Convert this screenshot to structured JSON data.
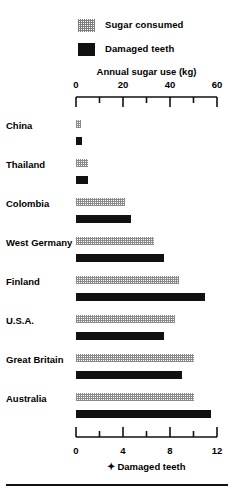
{
  "chart_data": {
    "type": "bar",
    "title": "",
    "orientation": "horizontal",
    "grid": false,
    "legend_position": "top",
    "categories": [
      "China",
      "Thailand",
      "Colombia",
      "West Germany",
      "Finland",
      "U.S.A.",
      "Great Britain",
      "Australia"
    ],
    "series": [
      {
        "name": "Sugar consumed",
        "axis": "top",
        "unit": "kg",
        "values": [
          2,
          5,
          21,
          33,
          44,
          42,
          50,
          50
        ]
      },
      {
        "name": "Damaged teeth",
        "axis": "bottom",
        "unit": "",
        "values": [
          0.5,
          1.0,
          4.7,
          7.5,
          11.0,
          7.5,
          9.0,
          11.5
        ]
      }
    ],
    "top_axis": {
      "label": "Annual sugar use (kg)",
      "lim": [
        0,
        60
      ],
      "major_ticks": [
        0,
        20,
        40,
        60
      ],
      "minor_ticks": [
        10,
        30,
        50
      ],
      "tick_labels": [
        "0",
        "20",
        "40",
        "60"
      ]
    },
    "bottom_axis": {
      "label": "Damaged teeth",
      "marker": "✦",
      "lim": [
        0,
        12
      ],
      "major_ticks": [
        0,
        4,
        8,
        12
      ],
      "minor_ticks": [
        2,
        6,
        10
      ],
      "tick_labels": [
        "0",
        "4",
        "8",
        "12"
      ]
    },
    "colors": {
      "ink": "#111111",
      "stipple": "#8a8a8a",
      "background": "#ffffff"
    }
  },
  "legend": {
    "items": [
      {
        "label": "Sugar consumed",
        "swatch": "stipple"
      },
      {
        "label": "Damaged teeth",
        "swatch": "solid"
      }
    ]
  }
}
